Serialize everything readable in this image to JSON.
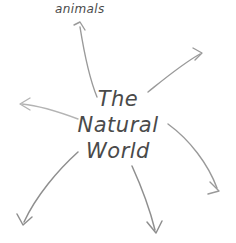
{
  "diagram": {
    "type": "mind-map",
    "background_color": "#ffffff",
    "stroke_color": "#9a9a9a",
    "text_color": "#4a4a4a",
    "center": {
      "name": "center-node",
      "lines": [
        "The",
        "Natural",
        "World"
      ],
      "full_text": "The Natural World"
    },
    "branches": [
      {
        "id": "animals",
        "label": "animals",
        "direction": "up",
        "has_label": true,
        "arrow_path": "M 97 97 C 90 80, 84 52, 80 27",
        "arrow_head": "M 74 25 L 80 22 L 85 30"
      },
      {
        "id": "branch-upper-right",
        "label": "",
        "direction": "up-right",
        "has_label": false,
        "arrow_path": "M 148 92 C 163 80, 182 64, 200 54",
        "arrow_head": "M 193 48 L 202 53 L 195 60"
      },
      {
        "id": "branch-left",
        "label": "",
        "direction": "left",
        "has_label": false,
        "arrow_path": "M 78 119 C 62 113, 42 106, 22 104",
        "arrow_head": "M 30 98 L 20 104 L 30 110"
      },
      {
        "id": "branch-right",
        "label": "",
        "direction": "right-down",
        "has_label": false,
        "arrow_path": "M 168 124 C 190 140, 208 164, 217 188",
        "arrow_head": "M 210 182 L 219 191 L 208 194"
      },
      {
        "id": "branch-lower-left",
        "label": "",
        "direction": "down-left",
        "has_label": false,
        "arrow_path": "M 78 152 C 58 170, 36 196, 24 222",
        "arrow_head": "M 17 214 L 23 225 L 32 217"
      },
      {
        "id": "branch-bottom",
        "label": "",
        "direction": "down",
        "has_label": false,
        "arrow_path": "M 132 166 C 142 188, 150 210, 155 230",
        "arrow_head": "M 147 222 L 156 233 L 162 221"
      }
    ]
  }
}
